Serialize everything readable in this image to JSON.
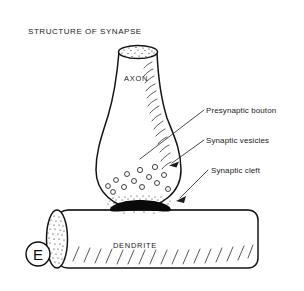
{
  "figure": {
    "title": "STRUCTURE OF SYNAPSE",
    "panel_letter": "E",
    "background_color": "#ffffff",
    "line_color": "#141414",
    "text_color": "#1b1b1b"
  },
  "structure_labels": {
    "axon": "AXON",
    "dendrite": "DENDRITE"
  },
  "callouts": [
    {
      "label": "Presynaptic bouton",
      "has_arrowhead": false
    },
    {
      "label": "Synaptic vesicles",
      "has_arrowhead": true
    },
    {
      "label": "Synaptic cleft",
      "has_arrowhead": true
    }
  ],
  "diagram_parts": {
    "axon_shaft": "axon-shaft",
    "axon_cut_face": "axon-cut-face-stippled",
    "presynaptic_bouton": "presynaptic-bouton-bulb",
    "synaptic_vesicles_count": 13,
    "synaptic_cleft": "synaptic-cleft-dark-band",
    "dendrite_shaft": "dendrite-shaft",
    "dendrite_cut_face": "dendrite-cut-face-stippled"
  }
}
